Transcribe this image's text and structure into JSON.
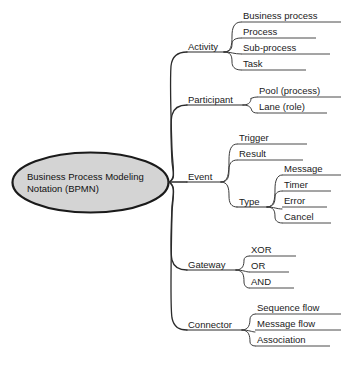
{
  "diagram": {
    "type": "mind-map",
    "title": "Business Process Modeling Notation (BPMN)",
    "root": {
      "label_line1": "Business Process Modeling",
      "label_line2": "Notation (BPMN)",
      "shape": "ellipse",
      "fill_color": "#d4d4d4",
      "stroke_color": "#1a1a1a"
    },
    "branches": [
      {
        "label": "Activity",
        "children": [
          {
            "label": "Business process"
          },
          {
            "label": "Process"
          },
          {
            "label": "Sub-process"
          },
          {
            "label": "Task"
          }
        ]
      },
      {
        "label": "Participant",
        "children": [
          {
            "label": "Pool (process)"
          },
          {
            "label": "Lane (role)"
          }
        ]
      },
      {
        "label": "Event",
        "children": [
          {
            "label": "Trigger"
          },
          {
            "label": "Result"
          },
          {
            "label": "Type",
            "children": [
              {
                "label": "Message"
              },
              {
                "label": "Timer"
              },
              {
                "label": "Error"
              },
              {
                "label": "Cancel"
              }
            ]
          }
        ]
      },
      {
        "label": "Gateway",
        "children": [
          {
            "label": "XOR"
          },
          {
            "label": "OR"
          },
          {
            "label": "AND"
          }
        ]
      },
      {
        "label": "Connector",
        "children": [
          {
            "label": "Sequence flow"
          },
          {
            "label": "Message flow"
          },
          {
            "label": "Association"
          }
        ]
      }
    ]
  }
}
